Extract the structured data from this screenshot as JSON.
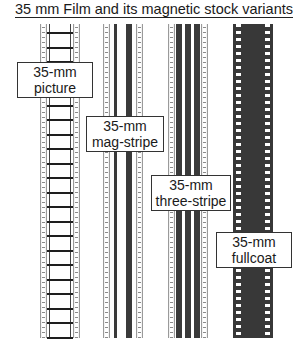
{
  "title": "35 mm Film and its magnetic stock variants",
  "strips": [
    {
      "id": "picture",
      "label_line1": "35-mm",
      "label_line2": "picture"
    },
    {
      "id": "mag-stripe",
      "label_line1": "35-mm",
      "label_line2": "mag-stripe"
    },
    {
      "id": "three-stripe",
      "label_line1": "35-mm",
      "label_line2": "three-stripe"
    },
    {
      "id": "fullcoat",
      "label_line1": "35-mm",
      "label_line2": "fullcoat"
    }
  ],
  "colors": {
    "stripe": "#3a3a3a",
    "fullcoat": "#383838",
    "edge": "#f2f2f2"
  }
}
